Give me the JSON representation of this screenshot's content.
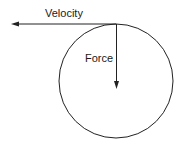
{
  "diagram": {
    "labels": {
      "velocity": "Velocity",
      "force": "Force"
    },
    "colors": {
      "stroke": "#222222",
      "background": "#ffffff"
    }
  }
}
